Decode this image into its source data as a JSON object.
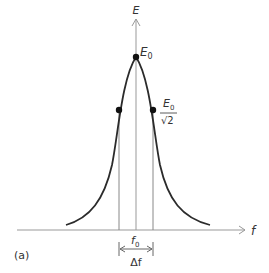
{
  "figure": {
    "panel_label": "(a)",
    "y_axis_label": "E",
    "x_axis_label": "f",
    "peak_label_main": "E",
    "peak_label_sub": "0",
    "half_label_num_main": "E",
    "half_label_num_sub": "0",
    "half_label_den": "√2",
    "center_label_main": "f",
    "center_label_sub": "0",
    "width_label": "Δf",
    "colors": {
      "curve": "#2b2b2b",
      "axis": "#999999",
      "guide": "#888888",
      "dot": "#111111",
      "text": "#333333"
    }
  }
}
